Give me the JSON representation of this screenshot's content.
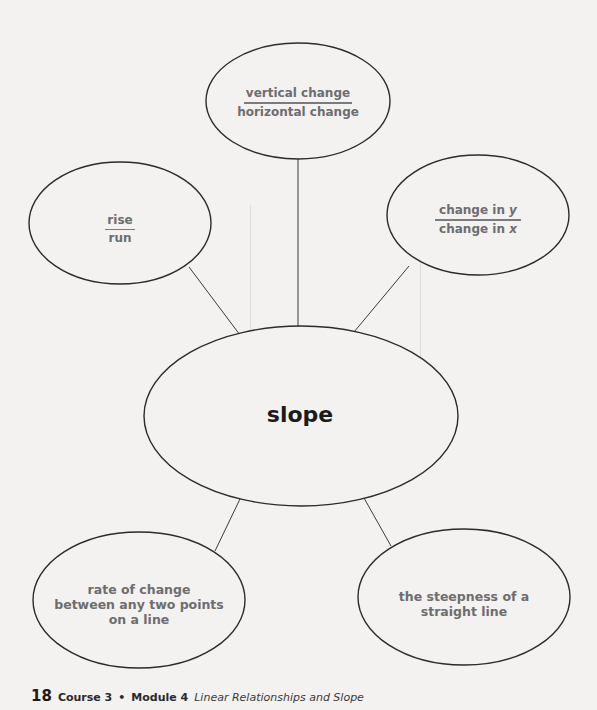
{
  "concept_map": {
    "center": {
      "label": "slope"
    },
    "nodes": [
      {
        "id": "top",
        "numerator": "vertical change",
        "denominator": "horizontal change"
      },
      {
        "id": "left",
        "numerator": "rise",
        "denominator": "run"
      },
      {
        "id": "right",
        "numerator": "change in y",
        "denominator": "change in x",
        "numerator_prefix": "change in ",
        "numerator_var": "y",
        "denominator_prefix": "change in ",
        "denominator_var": "x"
      },
      {
        "id": "bottom-left",
        "text_lines": [
          "rate of change",
          "between any two points",
          "on a line"
        ]
      },
      {
        "id": "bottom-right",
        "text_lines": [
          "the steepness of a",
          "straight line"
        ]
      }
    ]
  },
  "footer": {
    "page_number": "18",
    "course": "Course 3",
    "separator": "•",
    "module": "Module 4",
    "module_title": "Linear Relationships and Slope"
  },
  "colors": {
    "outline": "#2b2b2b",
    "node_text": "#6d6d6f",
    "center_text": "#1b1b1b",
    "background": "#f3f2f0"
  }
}
